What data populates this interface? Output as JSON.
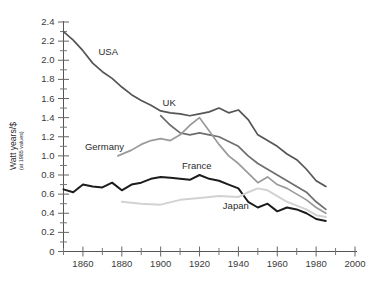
{
  "chart_data": {
    "type": "line",
    "title": "",
    "xlabel": "",
    "ylabel": "Watt years/$",
    "ylabel_suffix": "(at 1985 values)",
    "xlim": [
      1850,
      2000
    ],
    "ylim": [
      0,
      2.4
    ],
    "grid": false,
    "legend_position": "inline-labels",
    "x_ticks": [
      1860,
      1880,
      1900,
      1920,
      1940,
      1960,
      1980,
      2000
    ],
    "x_minor_ticks": [
      1850,
      1870,
      1890,
      1910,
      1930,
      1950,
      1970,
      1990
    ],
    "y_ticks": [
      0,
      0.2,
      0.4,
      0.6,
      0.8,
      1.0,
      1.2,
      1.4,
      1.6,
      1.8,
      2.0,
      2.2,
      2.4
    ],
    "y_tick_labels": [
      "0",
      "0.2",
      "0.4",
      "0.6",
      "0.8",
      "1.0",
      "1.2",
      "1.4",
      "1.6",
      "1.8",
      "2.0",
      "2.2",
      "2.4"
    ],
    "series": [
      {
        "name": "USA",
        "color": "#555555",
        "width": 1.7,
        "label_x": 1868,
        "label_y": 2.06,
        "x": [
          1850,
          1855,
          1860,
          1865,
          1870,
          1875,
          1880,
          1885,
          1890,
          1895,
          1900,
          1905,
          1910,
          1915,
          1920,
          1925,
          1930,
          1935,
          1940,
          1945,
          1950,
          1955,
          1960,
          1965,
          1970,
          1975,
          1980,
          1985
        ],
        "y": [
          2.3,
          2.21,
          2.1,
          1.97,
          1.88,
          1.81,
          1.72,
          1.64,
          1.58,
          1.53,
          1.47,
          1.45,
          1.44,
          1.42,
          1.44,
          1.46,
          1.5,
          1.45,
          1.48,
          1.38,
          1.22,
          1.16,
          1.1,
          1.02,
          0.96,
          0.86,
          0.74,
          0.68
        ]
      },
      {
        "name": "UK",
        "color": "#6e6e6e",
        "width": 1.7,
        "label_x": 1901,
        "label_y": 1.52,
        "x": [
          1900,
          1905,
          1910,
          1915,
          1920,
          1925,
          1930,
          1935,
          1940,
          1945,
          1950,
          1955,
          1960,
          1965,
          1970,
          1975,
          1980,
          1985
        ],
        "y": [
          1.42,
          1.32,
          1.24,
          1.22,
          1.24,
          1.22,
          1.2,
          1.15,
          1.1,
          1.0,
          0.92,
          0.86,
          0.8,
          0.74,
          0.68,
          0.62,
          0.52,
          0.44
        ]
      },
      {
        "name": "Germany",
        "color": "#9a9a9a",
        "width": 1.7,
        "label_x": 1861,
        "label_y": 1.06,
        "x": [
          1878,
          1885,
          1890,
          1895,
          1900,
          1905,
          1910,
          1915,
          1920,
          1925,
          1930,
          1935,
          1940,
          1945,
          1950,
          1955,
          1960,
          1965,
          1970,
          1975,
          1980,
          1985
        ],
        "y": [
          1.0,
          1.06,
          1.12,
          1.16,
          1.18,
          1.16,
          1.22,
          1.32,
          1.4,
          1.26,
          1.12,
          1.0,
          0.92,
          0.82,
          0.72,
          0.78,
          0.7,
          0.66,
          0.6,
          0.54,
          0.46,
          0.4
        ]
      },
      {
        "name": "France",
        "color": "#1c1c1c",
        "width": 2.0,
        "label_x": 1911,
        "label_y": 0.86,
        "x": [
          1850,
          1855,
          1860,
          1865,
          1870,
          1875,
          1880,
          1885,
          1890,
          1895,
          1900,
          1905,
          1910,
          1915,
          1920,
          1925,
          1930,
          1935,
          1940,
          1945,
          1950,
          1955,
          1960,
          1965,
          1970,
          1975,
          1980,
          1985
        ],
        "y": [
          0.65,
          0.62,
          0.7,
          0.68,
          0.67,
          0.72,
          0.64,
          0.7,
          0.72,
          0.76,
          0.78,
          0.77,
          0.76,
          0.75,
          0.8,
          0.76,
          0.74,
          0.7,
          0.66,
          0.52,
          0.46,
          0.5,
          0.42,
          0.46,
          0.44,
          0.4,
          0.34,
          0.32
        ]
      },
      {
        "name": "Japan",
        "color": "#d2d2d2",
        "width": 2.0,
        "label_x": 1932,
        "label_y": 0.44,
        "x": [
          1880,
          1890,
          1900,
          1910,
          1920,
          1930,
          1940,
          1945,
          1950,
          1955,
          1960,
          1965,
          1970,
          1975,
          1980,
          1985
        ],
        "y": [
          0.52,
          0.5,
          0.49,
          0.54,
          0.56,
          0.58,
          0.57,
          0.62,
          0.66,
          0.64,
          0.58,
          0.52,
          0.48,
          0.44,
          0.38,
          0.36
        ]
      }
    ]
  }
}
